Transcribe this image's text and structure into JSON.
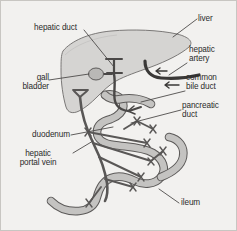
{
  "figure": {
    "background_color": "#f2f1ef",
    "border_color": "#c8c6c2",
    "organ_fill": "#d5d4d2",
    "organ_stroke": "#6e6c6b",
    "vessel_fill": "#b9b7b5",
    "vessel_stroke": "#4a4847",
    "vein_color": "#595756",
    "artery_color": "#3a3837",
    "leader_color": "#4e4c4b",
    "text_color": "#2b2b2b"
  },
  "labels": {
    "hepatic_duct": "hepatic duct",
    "liver": "liver",
    "hepatic_artery_line1": "hepatic",
    "hepatic_artery_line2": "artery",
    "common_bile_duct_line1": "common",
    "common_bile_duct_line2": "bile duct",
    "pancreatic_duct_line1": "pancreatic",
    "pancreatic_duct_line2": "duct",
    "gall_bladder_line1": "gall",
    "gall_bladder_line2": "bladder",
    "duodenum": "duodenum",
    "hepatic_portal_vein_line1": "hepatic",
    "hepatic_portal_vein_line2": "portal vein",
    "ileum": "ileum"
  },
  "structures": [
    {
      "name": "liver",
      "kind": "organ"
    },
    {
      "name": "gall-bladder",
      "kind": "organ"
    },
    {
      "name": "hepatic-duct",
      "kind": "duct"
    },
    {
      "name": "common-bile-duct",
      "kind": "duct"
    },
    {
      "name": "pancreatic-duct",
      "kind": "duct"
    },
    {
      "name": "hepatic-artery",
      "kind": "artery"
    },
    {
      "name": "duodenum",
      "kind": "intestine"
    },
    {
      "name": "ileum",
      "kind": "intestine"
    },
    {
      "name": "hepatic-portal-vein",
      "kind": "vein"
    }
  ]
}
